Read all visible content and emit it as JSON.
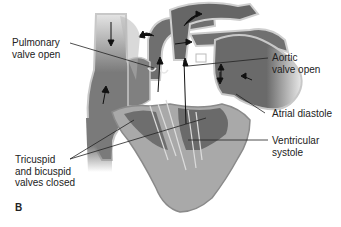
{
  "figure": {
    "panel_label": "B",
    "labels": {
      "pulmonary_valve": "Pulmonary\nvalve open",
      "aortic_valve": "Aortic\nvalve open",
      "atrial_diastole": "Atrial diastole",
      "ventricular_systole": "Ventricular\nsystole",
      "av_valves": "Tricuspid\nand bicuspid\nvalves closed"
    },
    "colors": {
      "vessel_fill": "#7a7a7a",
      "vessel_dark": "#5e5e5e",
      "wall_light": "#c8c8c8",
      "myocardium": "#a9a9a9",
      "leader_line": "#222222",
      "background": "#ffffff"
    }
  }
}
